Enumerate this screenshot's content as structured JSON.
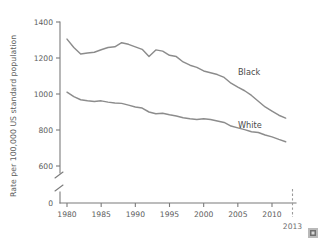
{
  "chart_data": {
    "type": "line",
    "title": "",
    "xlabel": "",
    "ylabel": "Rate per 100,000 US standard population",
    "xlim": [
      1979,
      2013
    ],
    "ylim": [
      600,
      1400
    ],
    "y_axis_break": true,
    "y_break_from": 0,
    "y_break_to": 600,
    "grid": false,
    "legend_position": "inline-right",
    "y_ticks": [
      "0",
      "600",
      "800",
      "1000",
      "1200",
      "1400"
    ],
    "y_tick_values": [
      0,
      600,
      800,
      1000,
      1200,
      1400
    ],
    "x_ticks": [
      "1980",
      "1985",
      "1990",
      "1995",
      "2000",
      "2005",
      "2010"
    ],
    "x_tick_values": [
      1980,
      1985,
      1990,
      1995,
      2000,
      2005,
      2010
    ],
    "annotations": [
      {
        "name": "end-year-marker",
        "label": "2013",
        "x": 2013,
        "style": "dashed-vertical"
      }
    ],
    "x": [
      1980,
      1981,
      1982,
      1983,
      1984,
      1985,
      1986,
      1987,
      1988,
      1989,
      1990,
      1991,
      1992,
      1993,
      1994,
      1995,
      1996,
      1997,
      1998,
      1999,
      2000,
      2001,
      2002,
      2003,
      2004,
      2005,
      2006,
      2007,
      2008,
      2009,
      2010,
      2011,
      2012
    ],
    "series": [
      {
        "name": "Black",
        "label": "Black",
        "color": "#8c8c8c",
        "values": [
          1305,
          1258,
          1222,
          1228,
          1232,
          1246,
          1258,
          1262,
          1285,
          1276,
          1262,
          1248,
          1208,
          1245,
          1238,
          1215,
          1208,
          1178,
          1160,
          1148,
          1128,
          1118,
          1108,
          1092,
          1060,
          1038,
          1018,
          992,
          960,
          928,
          905,
          882,
          866
        ]
      },
      {
        "name": "White",
        "label": "White",
        "color": "#8c8c8c",
        "values": [
          1010,
          985,
          968,
          962,
          958,
          962,
          955,
          950,
          948,
          938,
          928,
          922,
          900,
          890,
          893,
          885,
          878,
          868,
          862,
          858,
          862,
          858,
          850,
          842,
          822,
          812,
          802,
          790,
          786,
          772,
          762,
          748,
          735
        ]
      }
    ]
  },
  "corner_glyph": {
    "name": "image-placeholder-glyph"
  }
}
